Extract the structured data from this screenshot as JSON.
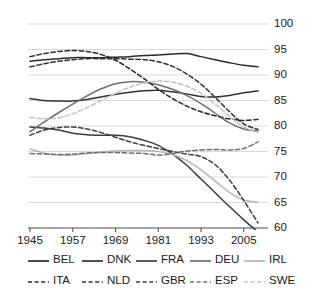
{
  "chart_data": {
    "type": "line",
    "title": "",
    "subtitle": "",
    "xlabel": "",
    "ylabel": "",
    "xlim": [
      1945,
      2009
    ],
    "ylim": [
      60,
      100
    ],
    "grid": true,
    "grid_axis": "y",
    "y_axis_position": "right",
    "legend_position": "bottom",
    "legend_columns": 5,
    "legend_rows": 2,
    "xticks": [
      1945,
      1957,
      1969,
      1981,
      1993,
      2005
    ],
    "xtick_labels": [
      "1945",
      "1957",
      "1969",
      "1981",
      "1993",
      "2005"
    ],
    "yticks": [
      60,
      65,
      70,
      75,
      80,
      85,
      90,
      95,
      100
    ],
    "ytick_labels": [
      "60",
      "65",
      "70",
      "75",
      "80",
      "85",
      "90",
      "95",
      "100"
    ],
    "x": [
      1945,
      1949,
      1953,
      1957,
      1961,
      1965,
      1969,
      1973,
      1977,
      1981,
      1985,
      1989,
      1993,
      1997,
      2001,
      2005,
      2009
    ],
    "series": [
      {
        "name": "BEL",
        "label": "BEL",
        "style": "solid",
        "color": "#2b2b2b",
        "values": [
          92.7,
          93.0,
          93.2,
          93.4,
          93.4,
          93.4,
          93.5,
          93.6,
          93.8,
          93.9,
          94.1,
          94.2,
          93.6,
          93.0,
          92.4,
          91.9,
          91.6
        ]
      },
      {
        "name": "DNK",
        "label": "DNK",
        "style": "solid",
        "color": "#333333",
        "values": [
          85.4,
          85.0,
          84.9,
          84.9,
          85.2,
          85.7,
          86.2,
          86.6,
          86.9,
          87.0,
          86.7,
          86.3,
          85.8,
          85.7,
          86.0,
          86.5,
          86.9
        ]
      },
      {
        "name": "FRA",
        "label": "FRA",
        "style": "solid",
        "color": "#3d3d3d",
        "values": [
          79.8,
          79.6,
          79.2,
          78.6,
          78.3,
          78.2,
          78.2,
          77.9,
          77.2,
          76.2,
          74.5,
          72.3,
          69.6,
          66.9,
          64.2,
          61.6,
          59.2
        ]
      },
      {
        "name": "DEU",
        "label": "DEU",
        "style": "solid",
        "color": "#6e6e6e",
        "values": [
          78.9,
          80.8,
          82.6,
          84.3,
          85.9,
          87.3,
          88.3,
          88.7,
          88.6,
          88.1,
          87.2,
          86.0,
          84.4,
          82.5,
          80.6,
          79.4,
          79.0
        ]
      },
      {
        "name": "IRL",
        "label": "IRL",
        "style": "solid",
        "color": "#b5b5b5",
        "values": [
          75.5,
          74.7,
          74.3,
          74.3,
          74.6,
          74.9,
          75.1,
          75.2,
          75.2,
          75.0,
          74.4,
          73.2,
          71.4,
          69.2,
          67.0,
          65.5,
          65.1
        ]
      },
      {
        "name": "ITA",
        "label": "ITA",
        "style": "dashed",
        "color": "#2b2b2b",
        "values": [
          93.6,
          94.2,
          94.6,
          94.8,
          94.6,
          94.0,
          92.9,
          91.2,
          89.3,
          87.2,
          85.4,
          83.9,
          82.8,
          82.0,
          81.4,
          81.1,
          81.3
        ]
      },
      {
        "name": "NLD",
        "label": "NLD",
        "style": "dashed",
        "color": "#333333",
        "values": [
          91.6,
          92.2,
          92.7,
          93.0,
          93.2,
          93.2,
          93.2,
          93.1,
          93.0,
          92.6,
          91.7,
          90.2,
          88.2,
          85.6,
          82.8,
          80.4,
          79.3
        ]
      },
      {
        "name": "GBR",
        "label": "GBR",
        "style": "dashed",
        "color": "#3d3d3d",
        "values": [
          78.2,
          79.2,
          79.7,
          79.8,
          79.4,
          78.7,
          77.8,
          76.9,
          76.2,
          75.6,
          75.0,
          74.5,
          74.0,
          72.4,
          69.4,
          65.4,
          61.0
        ]
      },
      {
        "name": "ESP",
        "label": "ESP",
        "style": "dashed",
        "color": "#707070",
        "values": [
          74.6,
          74.5,
          74.4,
          74.5,
          74.7,
          74.8,
          74.8,
          74.7,
          74.6,
          74.3,
          74.6,
          75.1,
          75.3,
          75.4,
          75.3,
          75.6,
          76.9
        ]
      },
      {
        "name": "SWE",
        "label": "SWE",
        "style": "dashed",
        "color": "#c2c2c2",
        "values": [
          81.7,
          81.4,
          81.6,
          82.4,
          83.6,
          85.0,
          86.4,
          87.6,
          88.4,
          88.8,
          88.6,
          87.8,
          86.4,
          84.3,
          81.9,
          79.8,
          78.8
        ]
      }
    ]
  }
}
